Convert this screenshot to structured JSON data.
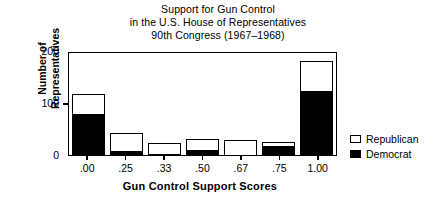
{
  "title": {
    "line1": "Support for Gun Control",
    "line2": "in the U.S. House of Representatives",
    "line3": "90th Congress (1967–1968)"
  },
  "axes": {
    "y_title_line1": "Number of",
    "y_title_line2": "Representatives",
    "x_title": "Gun Control Support Scores",
    "y_ticks": [
      "0",
      "100",
      "200"
    ]
  },
  "legend": {
    "items": [
      {
        "label": "Republican",
        "swatch": "hollow-square-icon",
        "color": "#ffffff"
      },
      {
        "label": "Democrat",
        "swatch": "filled-square-icon",
        "color": "#000000"
      }
    ]
  },
  "colors": {
    "republican": "#ffffff",
    "democrat": "#000000",
    "axis": "#000000",
    "background": "#ffffff"
  },
  "chart_data": {
    "type": "bar",
    "title": "Support for Gun Control in the U.S. House of Representatives 90th Congress (1967–1968)",
    "xlabel": "Gun Control Support Scores",
    "ylabel": "Number of Representatives",
    "categories": [
      ".00",
      ".25",
      ".33",
      ".50",
      ".67",
      ".75",
      "1.00"
    ],
    "ylim": [
      0,
      200
    ],
    "yticks": [
      0,
      100,
      200
    ],
    "grid": false,
    "stacked": true,
    "legend_position": "right",
    "series": [
      {
        "name": "Democrat",
        "color": "#000000",
        "values": [
          80,
          8,
          2,
          10,
          0,
          18,
          125
        ]
      },
      {
        "name": "Republican",
        "color": "#ffffff",
        "values": [
          38,
          34,
          22,
          20,
          28,
          7,
          55
        ]
      }
    ],
    "totals": [
      118,
      42,
      24,
      30,
      28,
      25,
      180
    ]
  }
}
